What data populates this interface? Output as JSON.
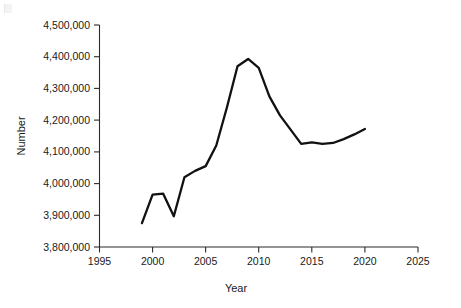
{
  "chart_data": {
    "type": "line",
    "title": "",
    "subtitle": "",
    "xlabel": "Year",
    "ylabel": "Number",
    "xlim": [
      1995,
      2025
    ],
    "ylim": [
      3800000,
      4500000
    ],
    "grid": false,
    "legend": null,
    "legend_position": "none",
    "x_ticks": [
      1995,
      2000,
      2005,
      2010,
      2015,
      2020,
      2025
    ],
    "x_tick_labels": [
      "1995",
      "2000",
      "2005",
      "2010",
      "2015",
      "2020",
      "2025"
    ],
    "y_ticks": [
      3800000,
      3900000,
      4000000,
      4100000,
      4200000,
      4300000,
      4400000,
      4500000
    ],
    "y_tick_labels": [
      "3,800,000",
      "3,900,000",
      "4,000,000",
      "4,100,000",
      "4,200,000",
      "4,300,000",
      "4,400,000",
      "4,500,000"
    ],
    "x": [
      1999,
      2000,
      2001,
      2002,
      2003,
      2004,
      2005,
      2006,
      2007,
      2008,
      2009,
      2010,
      2011,
      2012,
      2013,
      2014,
      2015,
      2016,
      2017,
      2018,
      2019,
      2020
    ],
    "series": [
      {
        "name": "Number",
        "values": [
          3875000,
          3965000,
          3968000,
          3897000,
          4020000,
          4040000,
          4055000,
          4120000,
          4240000,
          4370000,
          4393000,
          4365000,
          4275000,
          4215000,
          4170000,
          4125000,
          4130000,
          4125000,
          4128000,
          4140000,
          4155000,
          4172000
        ]
      }
    ],
    "annotations": []
  },
  "axes": {
    "y_title": "Number",
    "x_title": "Year"
  }
}
